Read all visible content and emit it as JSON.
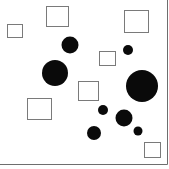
{
  "diagram": {
    "width": 169,
    "height": 169,
    "background": "#ffffff",
    "border": {
      "color": "#6e6e6e",
      "right_x": 167,
      "bottom_y": 164
    },
    "squares": [
      {
        "x": 7,
        "y": 24,
        "w": 15,
        "h": 13
      },
      {
        "x": 46,
        "y": 6,
        "w": 22,
        "h": 20
      },
      {
        "x": 124,
        "y": 10,
        "w": 24,
        "h": 22
      },
      {
        "x": 99,
        "y": 51,
        "w": 16,
        "h": 14
      },
      {
        "x": 78,
        "y": 81,
        "w": 20,
        "h": 19
      },
      {
        "x": 27,
        "y": 98,
        "w": 24,
        "h": 21
      },
      {
        "x": 144,
        "y": 142,
        "w": 16,
        "h": 15
      }
    ],
    "square_stroke": "#7a7a7a",
    "circles": [
      {
        "cx": 70,
        "cy": 45,
        "r": 8.5
      },
      {
        "cx": 55,
        "cy": 73,
        "r": 13
      },
      {
        "cx": 128,
        "cy": 50,
        "r": 5
      },
      {
        "cx": 142,
        "cy": 86,
        "r": 16
      },
      {
        "cx": 103,
        "cy": 110,
        "r": 5
      },
      {
        "cx": 124,
        "cy": 118,
        "r": 8.5
      },
      {
        "cx": 94,
        "cy": 133,
        "r": 7
      },
      {
        "cx": 138,
        "cy": 131,
        "r": 4.5
      }
    ],
    "circle_fill": "#0a0a0a"
  }
}
